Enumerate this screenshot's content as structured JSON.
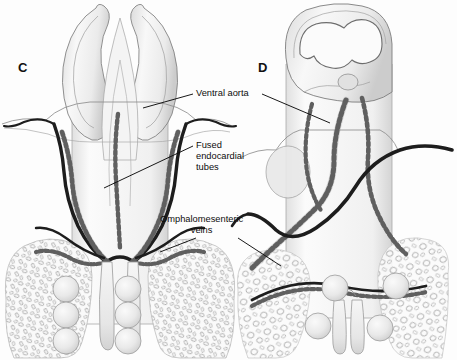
{
  "figure": {
    "background_color": "#fdfdfd",
    "panels": [
      {
        "letter": "C",
        "name": "panel-c",
        "description": "Open neural folds with paired fusing endocardial tubes",
        "letter_x": 18,
        "letter_y": 60,
        "somite_count": 6
      },
      {
        "letter": "D",
        "name": "panel-d",
        "description": "Closed convoluted neural tube with fused endocardial tube",
        "letter_x": 258,
        "letter_y": 60,
        "somite_count": 4
      }
    ],
    "callouts": [
      {
        "id": "ventral-aorta",
        "text": "Ventral aorta",
        "x": 196,
        "y": 88,
        "leaders": [
          {
            "x1": 193,
            "y1": 94,
            "x2": 143,
            "y2": 108
          },
          {
            "x1": 262,
            "y1": 94,
            "x2": 330,
            "y2": 123
          }
        ]
      },
      {
        "id": "fused-endocardial-tubes",
        "text": "Fused\nendocardial\ntubes",
        "x": 196,
        "y": 140,
        "leaders": [
          {
            "x1": 193,
            "y1": 146,
            "x2": 104,
            "y2": 188
          }
        ]
      },
      {
        "id": "omphalomesenteric-veins",
        "text": "Omphalomesenteric\nveins",
        "x": 160,
        "y": 214,
        "leaders": [
          {
            "x1": 196,
            "y1": 238,
            "x2": 160,
            "y2": 252
          },
          {
            "x1": 238,
            "y1": 238,
            "x2": 281,
            "y2": 266
          }
        ]
      }
    ],
    "colors": {
      "vessel_dark": "#1d1d1d",
      "outline": "#6f6f6f",
      "outline_light": "#9a9a9a",
      "tissue_fill": "#f2f2f2",
      "tissue_shade": "#dedede",
      "somite_fill": "#e8e8e8",
      "text": "#0d0d0d",
      "background": "#fdfdfd"
    }
  }
}
